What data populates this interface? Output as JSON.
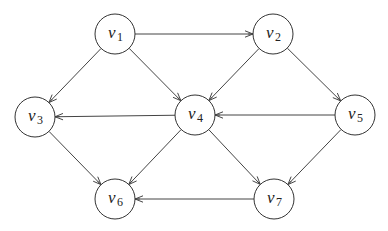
{
  "diagram": {
    "type": "directed-graph",
    "nodes": [
      {
        "id": "v1",
        "label": "v",
        "subscript": "1"
      },
      {
        "id": "v2",
        "label": "v",
        "subscript": "2"
      },
      {
        "id": "v3",
        "label": "v",
        "subscript": "3"
      },
      {
        "id": "v4",
        "label": "v",
        "subscript": "4"
      },
      {
        "id": "v5",
        "label": "v",
        "subscript": "5"
      },
      {
        "id": "v6",
        "label": "v",
        "subscript": "6"
      },
      {
        "id": "v7",
        "label": "v",
        "subscript": "7"
      }
    ],
    "edges": [
      {
        "from": "v1",
        "to": "v2"
      },
      {
        "from": "v1",
        "to": "v3"
      },
      {
        "from": "v1",
        "to": "v4"
      },
      {
        "from": "v2",
        "to": "v4"
      },
      {
        "from": "v2",
        "to": "v5"
      },
      {
        "from": "v4",
        "to": "v3"
      },
      {
        "from": "v5",
        "to": "v4"
      },
      {
        "from": "v3",
        "to": "v6"
      },
      {
        "from": "v4",
        "to": "v6"
      },
      {
        "from": "v4",
        "to": "v7"
      },
      {
        "from": "v5",
        "to": "v7"
      },
      {
        "from": "v7",
        "to": "v6"
      }
    ]
  }
}
